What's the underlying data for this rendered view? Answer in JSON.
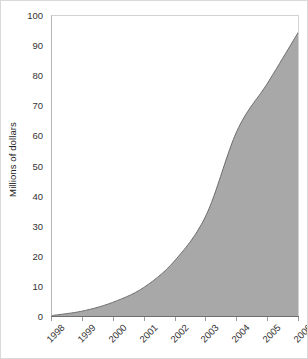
{
  "chart_data": {
    "type": "area",
    "title": "",
    "xlabel": "",
    "ylabel": "Millions of dollars",
    "categories": [
      "1998",
      "1999",
      "2000",
      "2001",
      "2002",
      "2003",
      "2004",
      "2005",
      "2006"
    ],
    "x": [
      1998,
      1999,
      2000,
      2001,
      2002,
      2003,
      2004,
      2005,
      2006
    ],
    "values": [
      0.5,
      2,
      5,
      10,
      19,
      34,
      62,
      78,
      95
    ],
    "ylim": [
      0,
      100
    ],
    "xlim": [
      1998,
      2006
    ],
    "yticks": [
      0,
      10,
      20,
      30,
      40,
      50,
      60,
      70,
      80,
      90,
      100
    ],
    "ytick_labels": [
      "0",
      "10",
      "20",
      "30",
      "40",
      "50",
      "60",
      "70",
      "80",
      "90",
      "100"
    ],
    "grid": false,
    "legend": false,
    "legend_position": "none",
    "series": [
      {
        "name": "Millions of dollars",
        "values": [
          0.5,
          2,
          5,
          10,
          19,
          34,
          62,
          78,
          95
        ]
      }
    ],
    "annotations": [],
    "xtick_rotation": -45,
    "colors": {
      "area_fill": "#a8a8a8",
      "area_line": "#6b6b6b",
      "axis_line": "#6f6f6f",
      "tick_text": "#333333",
      "title_text": "#222222",
      "plot_background": "#ffffff",
      "frame": "#d2d2d2"
    }
  }
}
